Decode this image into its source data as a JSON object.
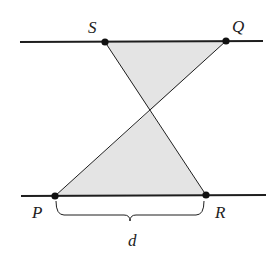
{
  "diagram": {
    "colors": {
      "line": "#1e1e1e",
      "shade": "#e4e4e4",
      "point": "#111111",
      "background": "#ffffff"
    },
    "points": {
      "S": {
        "label": "S",
        "x": 105,
        "y": 42,
        "label_x": 88,
        "label_y": 33
      },
      "Q": {
        "label": "Q",
        "x": 226,
        "y": 41,
        "label_x": 232,
        "label_y": 32
      },
      "P": {
        "label": "P",
        "x": 55,
        "y": 196,
        "label_x": 32,
        "label_y": 218
      },
      "R": {
        "label": "R",
        "x": 206,
        "y": 195,
        "label_x": 215,
        "label_y": 218
      },
      "X": {
        "x": 150,
        "y": 111
      }
    },
    "lines": {
      "top": {
        "x1": 20,
        "y1": 42,
        "x2": 263,
        "y2": 41
      },
      "bottom": {
        "x1": 21,
        "y1": 196,
        "x2": 266,
        "y2": 195
      }
    },
    "brace": {
      "label": "d",
      "x1": 56,
      "x2": 204,
      "y_top": 201,
      "y_mid": 221,
      "label_x": 128,
      "label_y": 246
    }
  }
}
